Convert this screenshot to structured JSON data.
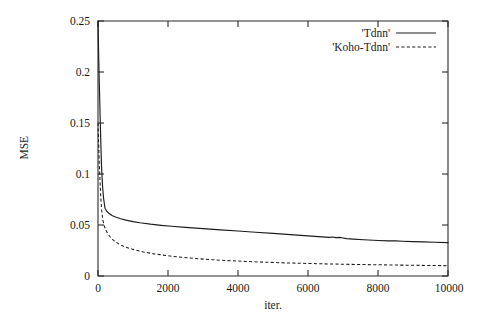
{
  "chart_data": {
    "type": "line",
    "title": "",
    "xlabel": "iter.",
    "ylabel": "MSE",
    "xlim": [
      0,
      10000
    ],
    "ylim": [
      0,
      0.25
    ],
    "grid": false,
    "legend_position": "top-right",
    "xticks": [
      "0",
      "2000",
      "4000",
      "6000",
      "8000",
      "10000"
    ],
    "xtick_values": [
      0,
      2000,
      4000,
      6000,
      8000,
      10000
    ],
    "yticks": [
      "0",
      "0.05",
      "0.1",
      "0.15",
      "0.2",
      "0.25"
    ],
    "ytick_values": [
      0,
      0.05,
      0.1,
      0.15,
      0.2,
      0.25
    ],
    "series": [
      {
        "name": "'Tdnn'",
        "style": "solid",
        "color": "#1c1c1c",
        "x": [
          0,
          20,
          40,
          60,
          80,
          100,
          130,
          160,
          200,
          250,
          300,
          400,
          500,
          650,
          800,
          1000,
          1200,
          1500,
          1800,
          2100,
          2500,
          3000,
          3500,
          4000,
          4500,
          5000,
          5500,
          6000,
          6400,
          6600,
          6700,
          6800,
          6900,
          7000,
          7100,
          7300,
          7600,
          8000,
          8300,
          8500,
          8700,
          9000,
          9300,
          9600,
          10000
        ],
        "y": [
          0.25,
          0.215,
          0.185,
          0.158,
          0.132,
          0.108,
          0.088,
          0.076,
          0.0665,
          0.0635,
          0.0618,
          0.0594,
          0.0578,
          0.0561,
          0.0548,
          0.0533,
          0.0522,
          0.0508,
          0.0497,
          0.0488,
          0.0477,
          0.0464,
          0.0452,
          0.0441,
          0.0429,
          0.0418,
          0.0406,
          0.0394,
          0.0384,
          0.0379,
          0.0382,
          0.0376,
          0.0378,
          0.0373,
          0.0367,
          0.0362,
          0.0355,
          0.0348,
          0.0344,
          0.0345,
          0.0341,
          0.0337,
          0.0334,
          0.0331,
          0.0327
        ]
      },
      {
        "name": "'Koho-Tdnn'",
        "style": "dashed",
        "color": "#1c1c1c",
        "x": [
          0,
          20,
          40,
          60,
          80,
          100,
          130,
          170,
          220,
          280,
          350,
          450,
          600,
          800,
          1000,
          1300,
          1600,
          2000,
          2400,
          2800,
          3200,
          3700,
          4200,
          4800,
          5400,
          6000,
          6600,
          7200,
          7800,
          8400,
          9000,
          9500,
          10000
        ],
        "y": [
          0.15,
          0.128,
          0.108,
          0.091,
          0.077,
          0.066,
          0.0565,
          0.05,
          0.0452,
          0.0415,
          0.0382,
          0.0348,
          0.0312,
          0.0281,
          0.0261,
          0.0236,
          0.0217,
          0.0198,
          0.0183,
          0.0171,
          0.0161,
          0.0151,
          0.0143,
          0.0135,
          0.0128,
          0.0123,
          0.0118,
          0.0114,
          0.0111,
          0.0108,
          0.0105,
          0.0103,
          0.0101
        ]
      }
    ],
    "annotations": [
      {
        "text": "small plateau bump in 'Tdnn'",
        "x_range": [
          6600,
          7100
        ],
        "y_approx": 0.038
      }
    ]
  },
  "legend": {
    "entries": [
      {
        "label": "'Tdnn'",
        "style": "solid"
      },
      {
        "label": "'Koho-Tdnn'",
        "style": "dashed"
      }
    ]
  },
  "colors": {
    "background": "#ffffff",
    "ink": "#1c1c1c",
    "axis": "#2b2b2b"
  }
}
